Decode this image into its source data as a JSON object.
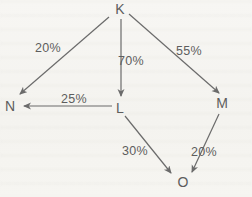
{
  "diagram": {
    "type": "directed-graph",
    "background_color": "#f5f4f1",
    "line_color": "#6b6b6b",
    "text_color": "#5d5d5d",
    "nodes": [
      {
        "id": "K",
        "label": "K",
        "x": 120,
        "y": 9
      },
      {
        "id": "N",
        "label": "N",
        "x": 10,
        "y": 106
      },
      {
        "id": "L",
        "label": "L",
        "x": 120,
        "y": 108
      },
      {
        "id": "M",
        "label": "M",
        "x": 222,
        "y": 103
      },
      {
        "id": "O",
        "label": "O",
        "x": 183,
        "y": 182
      }
    ],
    "edges": [
      {
        "from": "K",
        "to": "N",
        "label": "20%",
        "x1": 109,
        "y1": 17,
        "x2": 20,
        "y2": 94,
        "lx": 48,
        "ly": 48
      },
      {
        "from": "K",
        "to": "L",
        "label": "70%",
        "x1": 121,
        "y1": 19,
        "x2": 121,
        "y2": 96,
        "lx": 131,
        "ly": 61
      },
      {
        "from": "K",
        "to": "M",
        "label": "55%",
        "x1": 129,
        "y1": 14,
        "x2": 219,
        "y2": 93,
        "lx": 189,
        "ly": 51
      },
      {
        "from": "L",
        "to": "N",
        "label": "25%",
        "x1": 112,
        "y1": 106,
        "x2": 24,
        "y2": 106,
        "lx": 74,
        "ly": 99
      },
      {
        "from": "L",
        "to": "O",
        "label": "30%",
        "x1": 125,
        "y1": 116,
        "x2": 171,
        "y2": 173,
        "lx": 135,
        "ly": 151
      },
      {
        "from": "M",
        "to": "O",
        "label": "20%",
        "x1": 219,
        "y1": 114,
        "x2": 192,
        "y2": 172,
        "lx": 204,
        "ly": 152
      }
    ]
  }
}
